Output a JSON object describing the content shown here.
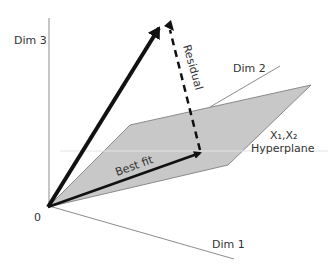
{
  "diagram": {
    "axes": {
      "dim3": "Dim 3",
      "dim2": "Dim 2",
      "dim1": "Dim 1",
      "origin": "0"
    },
    "vectors": {
      "residual": "Residual",
      "best_fit": "Best fit"
    },
    "plane": {
      "label_vars": "X₁,X₂",
      "label_name": "Hyperplane"
    },
    "colors": {
      "plane_fill": "#c8c8c8",
      "plane_edge": "#8a8a8a",
      "axis": "#8c8c8c",
      "vector": "#111111"
    }
  }
}
